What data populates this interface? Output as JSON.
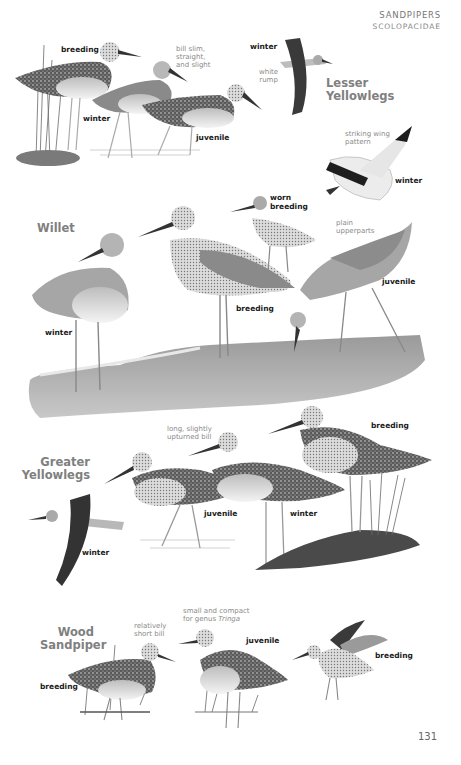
{
  "header": {
    "family_common": "SANDPIPERS",
    "family_scientific": "SCOLOPACIDAE"
  },
  "sections": [
    {
      "species": "Lesser Yellowlegs",
      "species_lines": [
        "Lesser",
        "Yellowlegs"
      ],
      "labels": [
        "breeding",
        "winter",
        "juvenile",
        "winter"
      ],
      "notes": [
        "bill slim, straight, and slight",
        "white rump",
        "striking wing pattern"
      ]
    },
    {
      "species": "Willet",
      "labels": [
        "winter",
        "breeding",
        "worn breeding",
        "juvenile",
        "winter"
      ],
      "notes": [
        "plain upperparts"
      ]
    },
    {
      "species": "Greater Yellowlegs",
      "species_lines": [
        "Greater",
        "Yellowlegs"
      ],
      "labels": [
        "winter",
        "juvenile",
        "winter",
        "breeding"
      ],
      "notes": [
        "long, slightly upturned bill"
      ]
    },
    {
      "species": "Wood Sandpiper",
      "species_lines": [
        "Wood",
        "Sandpiper"
      ],
      "labels": [
        "breeding",
        "juvenile",
        "breeding"
      ],
      "notes": [
        "relatively short bill",
        "small and compact for genus",
        "Tringa"
      ]
    }
  ],
  "lesser": {
    "name1": "Lesser",
    "name2": "Yellowlegs",
    "breeding": "breeding",
    "winter_standing": "winter",
    "juvenile": "juvenile",
    "winter_flight": "winter",
    "note_bill_1": "bill slim,",
    "note_bill_2": "straight,",
    "note_bill_3": "and slight",
    "note_rump_1": "white",
    "note_rump_2": "rump"
  },
  "willet": {
    "name": "Willet",
    "note_wing_1": "striking wing",
    "note_wing_2": "pattern",
    "winter_flight": "winter",
    "worn_1": "worn",
    "worn_2": "breeding",
    "note_plain_1": "plain",
    "note_plain_2": "upperparts",
    "juvenile": "juvenile",
    "breeding": "breeding",
    "winter": "winter"
  },
  "greater": {
    "name1": "Greater",
    "name2": "Yellowlegs",
    "note_bill_1": "long, slightly",
    "note_bill_2": "upturned bill",
    "breeding": "breeding",
    "juvenile": "juvenile",
    "winter_standing": "winter",
    "winter_flight": "winter"
  },
  "wood": {
    "name1": "Wood",
    "name2": "Sandpiper",
    "note_bill_1": "relatively",
    "note_bill_2": "short bill",
    "note_compact_1": "small and compact",
    "note_compact_2": "for genus ",
    "note_compact_italic": "Tringa",
    "juvenile": "juvenile",
    "breeding_left": "breeding",
    "breeding_right": "breeding"
  },
  "page_number": "131",
  "colors": {
    "species_title": "#808080",
    "label": "#1a1a1a",
    "note": "#8a8a8a",
    "header": "#777777"
  }
}
